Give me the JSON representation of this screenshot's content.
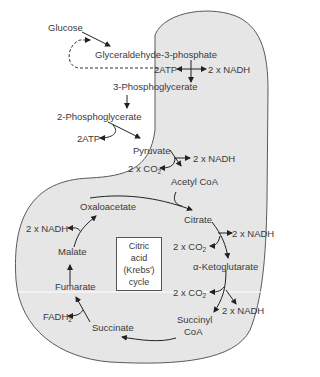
{
  "diagram": {
    "colors": {
      "mitochondrion_fill": "#e6e6e6",
      "outline": "#5a5a5a",
      "text": "#3a3a3a",
      "arrow": "#222222"
    },
    "glycolysis": {
      "glucose": "Glucose",
      "g3p": "Glyceraldehyde-3-phosphate",
      "atp_in": "2ATP",
      "nadh1": "2 x NADH",
      "pg3": "3-Phosphoglycerate",
      "pg2": "2-Phosphoglycerate",
      "atp_out": "2ATP",
      "pyruvate": "Pyruvate"
    },
    "link": {
      "nadh": "2 x NADH",
      "co2_prefix": "2 x CO",
      "co2_sub": "2",
      "acetyl_coa": "Acetyl CoA"
    },
    "krebs": {
      "center_line1": "Citric",
      "center_line2": "acid",
      "center_line3": "(Krebs')",
      "center_line4": "cycle",
      "citrate": "Citrate",
      "nadh_citrate": "2 x NADH",
      "co2_citrate_prefix": "2 x CO",
      "co2_citrate_sub": "2",
      "akg": "α-Ketoglutarate",
      "co2_akg_prefix": "2 x CO",
      "co2_akg_sub": "2",
      "nadh_akg": "2 x NADH",
      "succinyl_coa_1": "Succinyl",
      "succinyl_coa_2": "CoA",
      "succinate": "Succinate",
      "fadh_prefix": "FADH",
      "fadh_sub": "2",
      "fumarate": "Fumarate",
      "malate": "Malate",
      "nadh_malate": "2 x NADH",
      "oxaloacetate": "Oxaloacetate"
    }
  }
}
